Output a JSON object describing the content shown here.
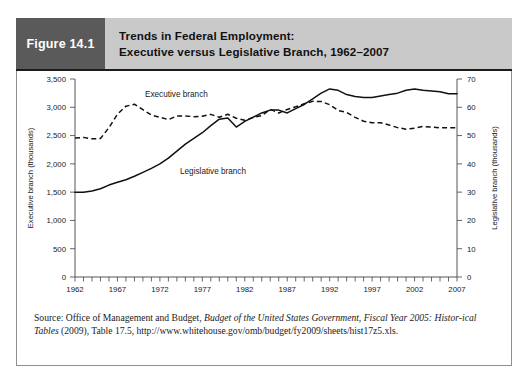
{
  "figure": {
    "number_label": "Figure 14.1",
    "title_line1": "Trends in Federal Employment:",
    "title_line2": "Executive versus Legislative Branch, 1962–2007"
  },
  "source": {
    "prefix": "Source: Office of Management and Budget, ",
    "italic1": "Budget of the United States Government, Fiscal Year 2005: Histor-",
    "italic2": "ical Tables",
    "suffix": " (2009), Table 17.5, http://www.whitehouse.gov/omb/budget/fy2009/sheets/hist17z5.xls."
  },
  "chart_data": {
    "type": "line",
    "title": "Trends in Federal Employment: Executive versus Legislative Branch, 1962–2007",
    "xlabel": "",
    "ylabel": "Executive branch (thousands)",
    "y2label": "Legislative branch (thousands)",
    "xlim": [
      1962,
      2007
    ],
    "ylim": [
      0,
      3500
    ],
    "y2lim": [
      0,
      70
    ],
    "y_ticks": [
      "0",
      "500",
      "1,000",
      "1,500",
      "2,000",
      "2,500",
      "3,000",
      "3,500"
    ],
    "y2_ticks": [
      "0",
      "10",
      "20",
      "30",
      "40",
      "50",
      "60",
      "70"
    ],
    "x_ticks": [
      "1962",
      "1967",
      "1972",
      "1977",
      "1982",
      "1987",
      "1992",
      "1997",
      "2002",
      "2007"
    ],
    "x_minor_tick_interval": 1,
    "grid": false,
    "legend_position": "inline-annotation",
    "x": [
      1962,
      1963,
      1964,
      1965,
      1966,
      1967,
      1968,
      1969,
      1970,
      1971,
      1972,
      1973,
      1974,
      1975,
      1976,
      1977,
      1978,
      1979,
      1980,
      1981,
      1982,
      1983,
      1984,
      1985,
      1986,
      1987,
      1988,
      1989,
      1990,
      1991,
      1992,
      1993,
      1994,
      1995,
      1996,
      1997,
      1998,
      1999,
      2000,
      2001,
      2002,
      2003,
      2004,
      2005,
      2006,
      2007
    ],
    "series": [
      {
        "name": "Executive branch",
        "axis": "left",
        "units": "thousands",
        "style": "dashed",
        "annotation": "Executive branch",
        "values": [
          2456,
          2468,
          2442,
          2448,
          2641,
          2877,
          3020,
          3054,
          2958,
          2862,
          2825,
          2781,
          2847,
          2848,
          2833,
          2840,
          2875,
          2823,
          2876,
          2806,
          2770,
          2820,
          2854,
          2964,
          2899,
          2962,
          3009,
          3064,
          3105,
          3103,
          3046,
          2944,
          2908,
          2822,
          2754,
          2726,
          2727,
          2687,
          2640,
          2613,
          2630,
          2661,
          2650,
          2637,
          2637,
          2636
        ]
      },
      {
        "name": "Legislative branch",
        "axis": "right",
        "units": "thousands",
        "style": "solid",
        "annotation": "Legislative branch",
        "values": [
          30.0,
          30.0,
          30.4,
          31.2,
          32.5,
          33.5,
          34.4,
          35.6,
          37.0,
          38.4,
          40.0,
          42.0,
          44.5,
          47.0,
          49.0,
          51.0,
          53.5,
          55.8,
          56.2,
          53.0,
          55.0,
          56.5,
          58.0,
          59.0,
          59.0,
          58.0,
          59.5,
          61.0,
          63.0,
          65.0,
          66.5,
          66.0,
          64.5,
          63.8,
          63.5,
          63.5,
          64.0,
          64.5,
          65.0,
          66.0,
          66.5,
          66.0,
          65.8,
          65.5,
          64.8,
          64.8
        ]
      }
    ]
  }
}
